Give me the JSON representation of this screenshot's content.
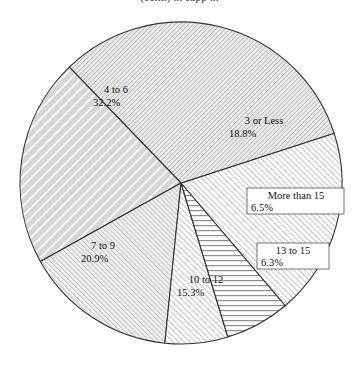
{
  "figure": {
    "title_partial": "(cont.) ... supp ...",
    "background_color": "#ffffff",
    "outline_color": "#333333",
    "width": 359,
    "height": 369
  },
  "chart_data": {
    "type": "pie",
    "title": "",
    "xlabel": "",
    "ylabel": "",
    "legend_position": "none",
    "grid": false,
    "start_angle_deg": -18,
    "direction": "clockwise",
    "center": {
      "x": 181,
      "y": 183
    },
    "radius": 161,
    "categories": [
      "3 or Less",
      "4 to 6",
      "7 to 9",
      "10 to 12",
      "13 to 15",
      "More than 15"
    ],
    "values": [
      18.8,
      32.2,
      20.9,
      15.3,
      6.3,
      6.5
    ],
    "value_suffix": "%",
    "slices": [
      {
        "label": "3 or Less",
        "value": "18.8%",
        "value_num": 18.8,
        "pattern": "diagonal-up-right-fine",
        "fill": "#ffffff",
        "hatch_color": "#b9b9b9",
        "label_x": 264,
        "label_y": 124,
        "boxed": false
      },
      {
        "label": "4 to 6",
        "value": "32.2%",
        "value_num": 32.2,
        "pattern": "diagonal-down-right-fine",
        "fill": "#e3e3e3",
        "hatch_color": "#b0b0b0",
        "label_x": 116,
        "label_y": 93,
        "boxed": false
      },
      {
        "label": "7 to 9",
        "value": "20.9%",
        "value_num": 20.9,
        "pattern": "diagonal-down-right-wide",
        "fill": "#e0e0e0",
        "hatch_color": "#ffffff",
        "label_x": 103,
        "label_y": 249,
        "boxed": false
      },
      {
        "label": "10 to 12",
        "value": "15.3%",
        "value_num": 15.3,
        "pattern": "diagonal-up-right-fine",
        "fill": "#e6e6e6",
        "hatch_color": "#bdbdbd",
        "label_x": 206,
        "label_y": 283,
        "boxed": false
      },
      {
        "label": "13 to 15",
        "value": "6.3%",
        "value_num": 6.3,
        "pattern": "diagonal-up-right-fine",
        "fill": "#ffffff",
        "hatch_color": "#bbbbbb",
        "label_x": 292,
        "label_y": 256,
        "boxed": true,
        "box_x": 257,
        "box_y": 243,
        "box_w": 72,
        "box_h": 26
      },
      {
        "label": "More than 15",
        "value": "6.5%",
        "value_num": 6.5,
        "pattern": "horizontal-lines",
        "fill": "#ffffff",
        "hatch_color": "#8f8f8f",
        "label_x": 295,
        "label_y": 200,
        "boxed": true,
        "box_x": 247,
        "box_y": 188,
        "box_w": 97,
        "box_h": 26
      }
    ]
  }
}
